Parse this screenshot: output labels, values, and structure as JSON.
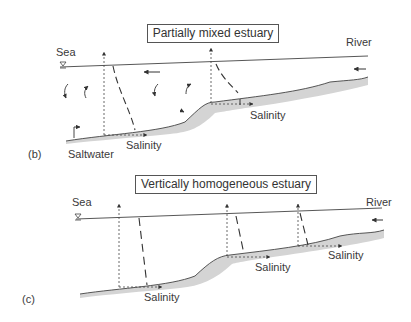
{
  "panel_b": {
    "label": "(b)",
    "title": "Partially mixed estuary",
    "sea_label": "Sea",
    "river_label": "River",
    "salinity_labels": [
      "Salinity",
      "Salinity"
    ],
    "saltwater_label": "Saltwater"
  },
  "panel_c": {
    "label": "(c)",
    "title": "Vertically homogeneous estuary",
    "sea_label": "Sea",
    "river_label": "River",
    "salinity_labels": [
      "Salinity",
      "Salinity",
      "Salinity"
    ]
  },
  "colors": {
    "line": "#444444",
    "bed_fill": "#d4d4d4",
    "text": "#3a3a3a"
  }
}
